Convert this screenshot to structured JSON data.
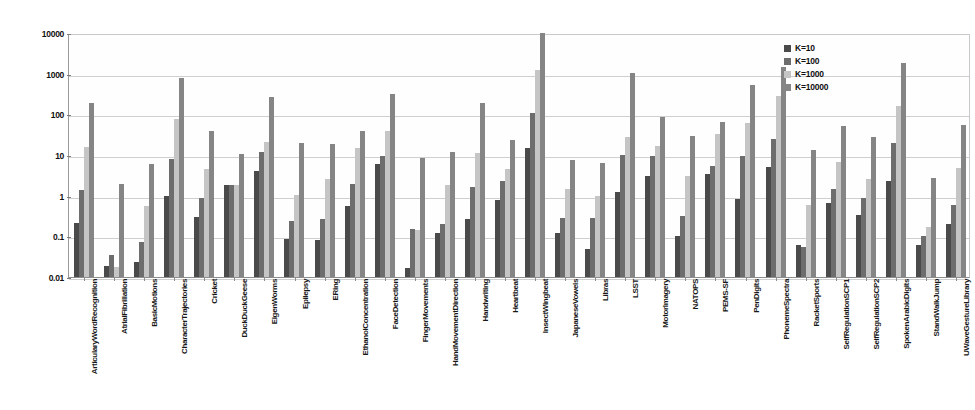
{
  "chart_data": {
    "type": "bar",
    "title": "",
    "xlabel": "",
    "ylabel": "",
    "yscale": "log",
    "ylim": [
      0.01,
      10000
    ],
    "ytick_labels": [
      "10000",
      "1000",
      "100",
      "10",
      "1",
      "0.1",
      "0.01"
    ],
    "ytick_values": [
      10000,
      1000,
      100,
      10,
      1,
      0.1,
      0.01
    ],
    "grid": true,
    "legend_position": "top-right",
    "legend": [
      "K=10",
      "K=100",
      "K=1000",
      "K=10000"
    ],
    "series_colors": [
      "#4a4a4a",
      "#6d6d6d",
      "#c5c5c5",
      "#858585"
    ],
    "categories": [
      "ArticularyWordRecognition",
      "AtrialFibrillation",
      "BasicMotions",
      "CharacterTrajectories",
      "Cricket",
      "DuckDuckGeese",
      "EigenWorms",
      "Epilepsy",
      "ERing",
      "EthanolConcentration",
      "FaceDetection",
      "FingerMovements",
      "HandMovementDirection",
      "Handwriting",
      "Heartbeat",
      "InsectWingbeat",
      "JapaneseVowels",
      "Libras",
      "LSST",
      "MotorImagery",
      "NATOPS",
      "PEMS-SF",
      "PenDigits",
      "PhonemeSpectra",
      "RacketSports",
      "SelfRegulationSCP1",
      "SelfRegulationSCP2",
      "SpokenArabicDigits",
      "StandWalkJump",
      "UWaveGestureLibrary"
    ],
    "series": [
      {
        "name": "K=10",
        "values": [
          0.21,
          0.019,
          0.023,
          1.0,
          0.3,
          1.8,
          4.0,
          0.085,
          0.08,
          0.55,
          6.0,
          0.017,
          0.12,
          0.26,
          0.8,
          15.0,
          0.12,
          0.05,
          1.2,
          3.0,
          0.1,
          3.5,
          0.85,
          5.0,
          0.06,
          0.65,
          0.33,
          2.3,
          0.062,
          0.2
        ]
      },
      {
        "name": "K=100",
        "values": [
          1.4,
          0.035,
          0.072,
          8.0,
          0.87,
          1.85,
          12.0,
          0.24,
          0.26,
          1.9,
          9.5,
          0.15,
          0.2,
          1.6,
          2.3,
          110.0,
          0.28,
          0.29,
          10.0,
          9.5,
          0.31,
          5.5,
          9.5,
          25.0,
          0.055,
          1.5,
          0.9,
          20.0,
          0.1,
          0.6
        ]
      },
      {
        "name": "K=1000",
        "values": [
          16.0,
          0.018,
          0.55,
          75.0,
          4.5,
          1.8,
          21.0,
          1.05,
          2.6,
          15.0,
          39.0,
          0.14,
          1.85,
          11.0,
          4.6,
          1200.0,
          1.5,
          1.0,
          27.0,
          17.0,
          3.0,
          33.0,
          60.0,
          290.0,
          0.6,
          6.8,
          2.5,
          160.0,
          0.17,
          4.8
        ]
      },
      {
        "name": "K=10000",
        "values": [
          190.0,
          1.9,
          6.0,
          780.0,
          39.0,
          10.5,
          270.0,
          20.0,
          19.0,
          38.0,
          310.0,
          8.5,
          12.0,
          190.0,
          23.0,
          10000.0,
          7.5,
          6.2,
          1050.0,
          88.0,
          30.0,
          65.0,
          530.0,
          1450.0,
          13.0,
          52.0,
          28.0,
          1800.0,
          2.7,
          55.0
        ]
      }
    ]
  }
}
